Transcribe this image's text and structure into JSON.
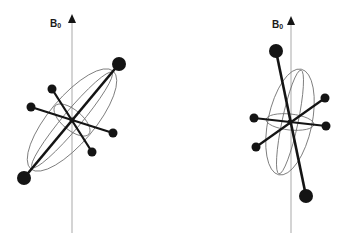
{
  "figure": {
    "colors": {
      "axis": "#b8b8b8",
      "bond": "#141414",
      "atom": "#141414",
      "ellipse": "#6a6a6a",
      "label": "#1a1a1a"
    },
    "panels": [
      {
        "id": "left",
        "field_label": {
          "main": "B",
          "sub": "0"
        },
        "label_pos": [
          50,
          19
        ],
        "axis": {
          "x": 72,
          "y_top": 14,
          "y_bottom": 233
        },
        "center": [
          72,
          120
        ],
        "atoms_large": [
          [
            119,
            64
          ],
          [
            24,
            178
          ]
        ],
        "atoms_small": [
          [
            52,
            89
          ],
          [
            92,
            152
          ],
          [
            31,
            107
          ],
          [
            113,
            133
          ]
        ],
        "ellipses": [
          {
            "cx": 72,
            "cy": 120,
            "rx": 64,
            "ry": 23,
            "rot": -50
          },
          {
            "cx": 72,
            "cy": 120,
            "rx": 62,
            "ry": 9,
            "rot": -50
          },
          {
            "cx": 72,
            "cy": 120,
            "rx": 22,
            "ry": 10,
            "rot": 40
          }
        ]
      },
      {
        "id": "right",
        "field_label": {
          "main": "B",
          "sub": "0"
        },
        "label_pos": [
          272,
          20
        ],
        "axis": {
          "x": 291,
          "y_top": 16,
          "y_bottom": 233
        },
        "center": [
          290,
          122
        ],
        "atoms_large": [
          [
            276,
            51
          ],
          [
            306,
            196
          ]
        ],
        "atoms_small": [
          [
            254,
            118
          ],
          [
            326,
            126
          ],
          [
            325,
            98
          ],
          [
            256,
            147
          ]
        ],
        "ellipses": [
          {
            "cx": 290,
            "cy": 122,
            "rx": 54,
            "ry": 22,
            "rot": -78
          },
          {
            "cx": 290,
            "cy": 122,
            "rx": 53,
            "ry": 8,
            "rot": -78
          },
          {
            "cx": 290,
            "cy": 122,
            "rx": 24,
            "ry": 8,
            "rot": 6
          }
        ]
      }
    ]
  }
}
